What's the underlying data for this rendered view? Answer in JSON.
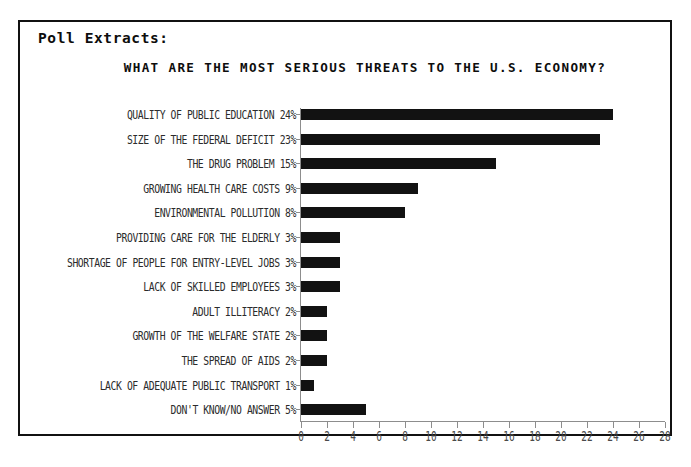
{
  "panel": {
    "section_label": "Poll Extracts:",
    "border_color": "#111111",
    "background": "#ffffff"
  },
  "chart_data": {
    "type": "bar",
    "orientation": "horizontal",
    "title": "WHAT ARE THE MOST SERIOUS THREATS TO THE U.S. ECONOMY?",
    "xlabel": "",
    "ylabel": "",
    "xlim": [
      0,
      28
    ],
    "xtick_step": 2,
    "xticks": [
      0,
      2,
      4,
      6,
      8,
      10,
      12,
      14,
      16,
      18,
      20,
      22,
      24,
      26,
      28
    ],
    "xticklabels": [
      "0",
      "2",
      "4",
      "6",
      "8",
      "10",
      "12",
      "14",
      "16",
      "18",
      "20",
      "22",
      "24",
      "26",
      "28"
    ],
    "grid": false,
    "legend": false,
    "bar_color": "#121212",
    "axis_color": "#8d8d8d",
    "categories": [
      "QUALITY OF PUBLIC EDUCATION",
      "SIZE OF THE FEDERAL DEFICIT",
      "THE DRUG PROBLEM",
      "GROWING HEALTH CARE COSTS",
      "ENVIRONMENTAL POLLUTION",
      "PROVIDING CARE FOR THE ELDERLY",
      "SHORTAGE OF PEOPLE FOR ENTRY-LEVEL JOBS",
      "LACK OF SKILLED EMPLOYEES",
      "ADULT ILLITERACY",
      "GROWTH OF THE WELFARE STATE",
      "THE SPREAD OF AIDS",
      "LACK OF ADEQUATE PUBLIC TRANSPORT",
      "DON'T KNOW/NO ANSWER"
    ],
    "values": [
      24,
      23,
      15,
      9,
      8,
      3,
      3,
      3,
      2,
      2,
      2,
      1,
      5
    ],
    "value_labels": [
      "24%",
      "23%",
      "15%",
      "9%",
      "8%",
      "3%",
      "3%",
      "3%",
      "2%",
      "2%",
      "2%",
      "1%",
      "5%"
    ],
    "rows": [
      {
        "label": "QUALITY OF PUBLIC EDUCATION 24%",
        "value": 24
      },
      {
        "label": "SIZE OF THE FEDERAL DEFICIT 23%",
        "value": 23
      },
      {
        "label": "THE DRUG PROBLEM 15%",
        "value": 15
      },
      {
        "label": "GROWING HEALTH CARE COSTS 9%",
        "value": 9
      },
      {
        "label": "ENVIRONMENTAL POLLUTION 8%",
        "value": 8
      },
      {
        "label": "PROVIDING CARE FOR THE ELDERLY 3%",
        "value": 3
      },
      {
        "label": "SHORTAGE OF PEOPLE FOR ENTRY-LEVEL JOBS 3%",
        "value": 3
      },
      {
        "label": "LACK OF SKILLED EMPLOYEES 3%",
        "value": 3
      },
      {
        "label": "ADULT ILLITERACY 2%",
        "value": 2
      },
      {
        "label": "GROWTH OF THE WELFARE STATE 2%",
        "value": 2
      },
      {
        "label": "THE SPREAD OF AIDS 2%",
        "value": 2
      },
      {
        "label": "LACK OF ADEQUATE PUBLIC TRANSPORT 1%",
        "value": 1
      },
      {
        "label": "DON'T KNOW/NO ANSWER 5%",
        "value": 5
      }
    ]
  }
}
